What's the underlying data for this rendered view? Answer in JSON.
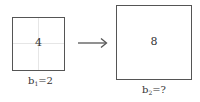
{
  "diagram": {
    "small_square": {
      "value": "4",
      "label_base": "b",
      "label_sub": "1",
      "label_rest": "=2",
      "grid": "2x2 faint gridlines"
    },
    "arrow": {
      "direction": "right"
    },
    "large_square": {
      "value": "8",
      "label_base": "b",
      "label_sub": "2",
      "label_rest": "=?"
    },
    "colors": {
      "border": "#555555",
      "grid": "#e6e6e6",
      "text": "#333333",
      "arrow": "#555555"
    }
  }
}
